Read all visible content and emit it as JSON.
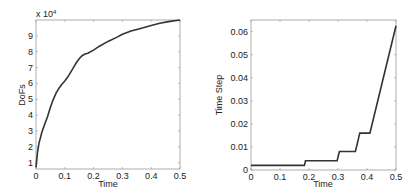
{
  "chart_data": [
    {
      "type": "line",
      "title": "",
      "xlabel": "Time",
      "ylabel": "DoFs",
      "y_multiplier_label": "x 10^4",
      "y_multiplier_text": "x 10",
      "y_multiplier_exp": "4",
      "xlim": [
        0,
        0.5
      ],
      "ylim": [
        0.6,
        10
      ],
      "grid": false,
      "legend": null,
      "x_ticks": [
        "0",
        "0.1",
        "0.2",
        "0.3",
        "0.4",
        "0.5"
      ],
      "y_ticks": [
        "1",
        "2",
        "3",
        "4",
        "5",
        "6",
        "7",
        "8",
        "9"
      ],
      "series": [
        {
          "name": "DoFs",
          "color": "#333333",
          "x": [
            0,
            0.005,
            0.01,
            0.02,
            0.03,
            0.04,
            0.05,
            0.06,
            0.07,
            0.08,
            0.09,
            0.1,
            0.11,
            0.12,
            0.13,
            0.14,
            0.15,
            0.16,
            0.17,
            0.18,
            0.2,
            0.22,
            0.25,
            0.28,
            0.3,
            0.33,
            0.36,
            0.4,
            0.43,
            0.46,
            0.5
          ],
          "y": [
            0.7,
            1.6,
            2.2,
            2.9,
            3.4,
            3.9,
            4.5,
            5.0,
            5.4,
            5.7,
            5.95,
            6.15,
            6.4,
            6.7,
            7.0,
            7.3,
            7.55,
            7.75,
            7.85,
            7.9,
            8.1,
            8.35,
            8.65,
            8.9,
            9.1,
            9.3,
            9.45,
            9.65,
            9.8,
            9.9,
            10.0
          ]
        }
      ]
    },
    {
      "type": "line",
      "title": "",
      "xlabel": "Time",
      "ylabel": "Time Step",
      "xlim": [
        0,
        0.5
      ],
      "ylim": [
        0,
        0.065
      ],
      "grid": false,
      "legend": null,
      "x_ticks": [
        "0",
        "0.1",
        "0.2",
        "0.3",
        "0.4",
        "0.5"
      ],
      "y_ticks": [
        "0",
        "0.01",
        "0.02",
        "0.03",
        "0.04",
        "0.05",
        "0.06"
      ],
      "series": [
        {
          "name": "Time Step",
          "color": "#333333",
          "x": [
            0,
            0.184,
            0.188,
            0.297,
            0.305,
            0.36,
            0.375,
            0.41,
            0.5
          ],
          "y": [
            0.002,
            0.002,
            0.004,
            0.004,
            0.008,
            0.008,
            0.016,
            0.016,
            0.0625
          ]
        }
      ]
    }
  ]
}
